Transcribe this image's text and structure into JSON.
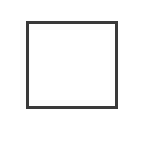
{
  "canvas": {
    "width": 143,
    "height": 166,
    "background": "#ffffff"
  },
  "shapes": [
    {
      "type": "square",
      "stroke": "#3a3a3a",
      "stroke_width": 3,
      "fill": "#ffffff"
    }
  ]
}
